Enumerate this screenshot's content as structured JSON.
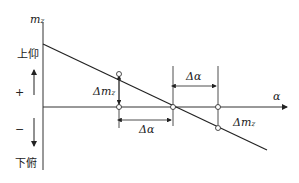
{
  "diagram": {
    "y_axis_label": "m",
    "y_axis_sub": "z",
    "x_axis_label": "α",
    "upper_label": "上仰",
    "lower_label": "下俯",
    "plus": "+",
    "minus": "−",
    "delta_m_left": "Δm",
    "delta_m_left_sub": "z",
    "delta_m_right": "Δm",
    "delta_m_right_sub": "z",
    "delta_alpha_bottom": "Δα",
    "delta_alpha_top": "Δα",
    "colors": {
      "line": "#222222",
      "axis": "#333333"
    }
  }
}
